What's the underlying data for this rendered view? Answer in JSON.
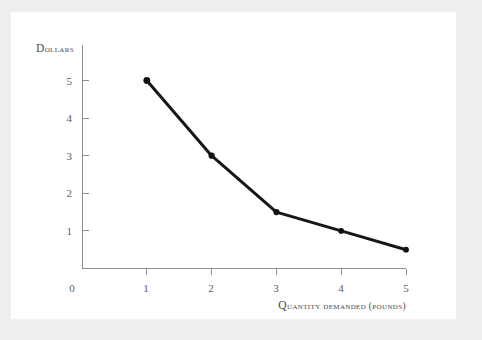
{
  "figure": {
    "background_color": "#eeeeee",
    "card_color": "#ffffff",
    "line_color": "#161616",
    "axis_color": "#8d8d8d",
    "text_color": "#4a4a4a"
  },
  "chart_data": {
    "type": "line",
    "title": "",
    "subtitle": "",
    "xlabel": "Quantity demanded (pounds)",
    "ylabel": "Dollars",
    "x": [
      1,
      2,
      3,
      4,
      5
    ],
    "values": [
      5,
      3,
      1.5,
      1,
      0.5
    ],
    "series": [
      {
        "name": "Demand",
        "x": [
          1,
          2,
          3,
          4,
          5
        ],
        "values": [
          5,
          3,
          1.5,
          1,
          0.5
        ]
      }
    ],
    "xlim": [
      0,
      5
    ],
    "ylim": [
      0,
      5.6
    ],
    "x_ticks": [
      0,
      1,
      2,
      3,
      4,
      5
    ],
    "y_ticks": [
      1,
      2,
      3,
      4,
      5
    ],
    "x_tick_labels": [
      "0",
      "1",
      "2",
      "3",
      "4",
      "5"
    ],
    "y_tick_labels": [
      "1",
      "2",
      "3",
      "4",
      "5"
    ],
    "origin_label": "0",
    "grid": false,
    "legend": false,
    "legend_position": "none",
    "markers": true,
    "marker_shape": "circle",
    "annotations": []
  },
  "labels": {
    "y_axis_title": "Dollars",
    "x_axis_title": "Quantity demanded (pounds)",
    "y_axis_title_lead": "D",
    "y_axis_title_rest": "ollars",
    "x_axis_title_lead": "Q",
    "x_axis_title_rest": "uantity demanded (pounds)"
  },
  "ticks": {
    "y": [
      {
        "label": "5",
        "value": 5
      },
      {
        "label": "4",
        "value": 4
      },
      {
        "label": "3",
        "value": 3
      },
      {
        "label": "2",
        "value": 2
      },
      {
        "label": "1",
        "value": 1
      }
    ],
    "x": [
      {
        "label": "1",
        "value": 1
      },
      {
        "label": "2",
        "value": 2
      },
      {
        "label": "3",
        "value": 3
      },
      {
        "label": "4",
        "value": 4
      },
      {
        "label": "5",
        "value": 5
      }
    ],
    "origin": "0"
  }
}
